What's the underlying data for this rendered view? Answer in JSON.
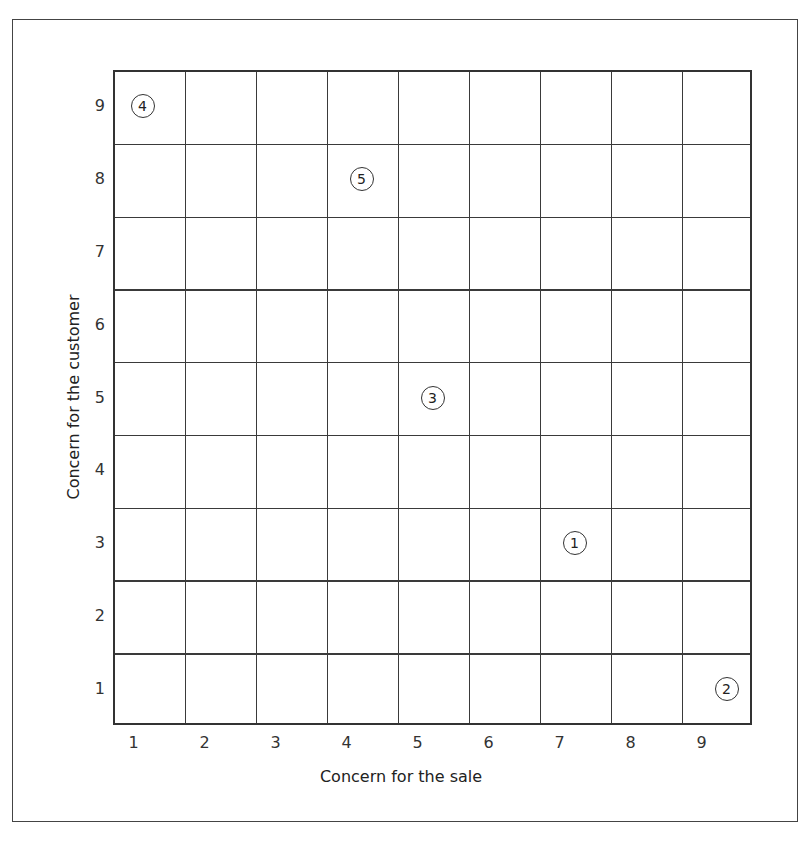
{
  "chart_data": {
    "type": "scatter",
    "title": "",
    "xlabel": "Concern for the sale",
    "ylabel": "Concern for the customer",
    "x_ticks": [
      "1",
      "2",
      "3",
      "4",
      "5",
      "6",
      "7",
      "8",
      "9"
    ],
    "y_ticks": [
      "1",
      "2",
      "3",
      "4",
      "5",
      "6",
      "7",
      "8",
      "9"
    ],
    "xlim": [
      1,
      9
    ],
    "ylim": [
      1,
      9
    ],
    "grid": true,
    "points": [
      {
        "label": "1",
        "x": 7,
        "y": 3
      },
      {
        "label": "2",
        "x": 9,
        "y": 1
      },
      {
        "label": "3",
        "x": 5,
        "y": 5
      },
      {
        "label": "4",
        "x": 1,
        "y": 9
      },
      {
        "label": "5",
        "x": 4,
        "y": 8
      }
    ]
  }
}
